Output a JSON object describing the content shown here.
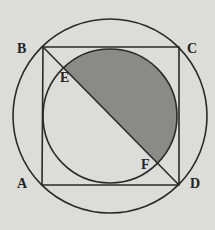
{
  "diagram": {
    "type": "geometry",
    "labels": {
      "A": "A",
      "B": "B",
      "C": "C",
      "D": "D",
      "E": "E",
      "F": "F"
    },
    "colors": {
      "background": "#dcdcd8",
      "stroke": "#2a2a2a",
      "shade": "#8a8a88"
    }
  }
}
